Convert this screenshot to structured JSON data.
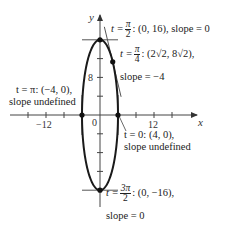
{
  "figure": {
    "type": "parametric-curve-diagram",
    "axes": {
      "x_label": "x",
      "y_label": "y",
      "x_range": [
        -20,
        20
      ],
      "y_range": [
        -20,
        20
      ],
      "x_tick_step": 4,
      "y_tick_step": 4,
      "x_tick_labels": [
        {
          "value": -12,
          "text": "−12"
        },
        {
          "value": 12,
          "text": "12"
        }
      ],
      "y_tick_labels": [
        {
          "value": 8,
          "text": "8"
        }
      ],
      "origin_label": "0"
    },
    "curve": {
      "x_semi_axis": 4,
      "y_semi_axis": 16,
      "color": "#1a1a1a"
    },
    "points": [
      {
        "t_text": "t =",
        "t_num": "π",
        "t_den": "2",
        "coord_text": ": (0, 16), slope = 0",
        "slope_text": "",
        "x": 0,
        "y": 16,
        "slope": 0
      },
      {
        "t_text": "t =",
        "t_num": "π",
        "t_den": "4",
        "coord_text": ": (2√2, 8√2),",
        "slope_text": "slope = −4",
        "x": 2.8284,
        "y": 11.3137,
        "slope": -4
      },
      {
        "t_text": "t = π: (−4, 0),",
        "slope_text": "slope undefined",
        "x": -4,
        "y": 0,
        "slope": "undefined"
      },
      {
        "t_text": "t = 0: (4, 0),",
        "slope_text": "slope undefined",
        "x": 4,
        "y": 0,
        "slope": "undefined"
      },
      {
        "t_text": "t =",
        "t_num": "3π",
        "t_den": "2",
        "coord_text": ": (0, −16),",
        "slope_text": "slope = 0",
        "x": 0,
        "y": -16,
        "slope": 0
      }
    ]
  }
}
